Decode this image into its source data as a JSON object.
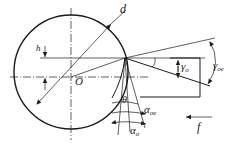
{
  "diagram": {
    "type": "technical-geometry",
    "labels": {
      "diameter": "d",
      "offset": "h",
      "center": "O",
      "theta": "θ",
      "gamma_o": {
        "base": "γ",
        "sub": "o"
      },
      "gamma_oe": {
        "base": "γ",
        "sub": "oe"
      },
      "alpha_o": {
        "base": "α",
        "sub": "o"
      },
      "alpha_oe": {
        "base": "α",
        "sub": "oe"
      },
      "feed": "f"
    },
    "colors": {
      "line": "#1a1a1a",
      "background": "#ffffff"
    }
  }
}
